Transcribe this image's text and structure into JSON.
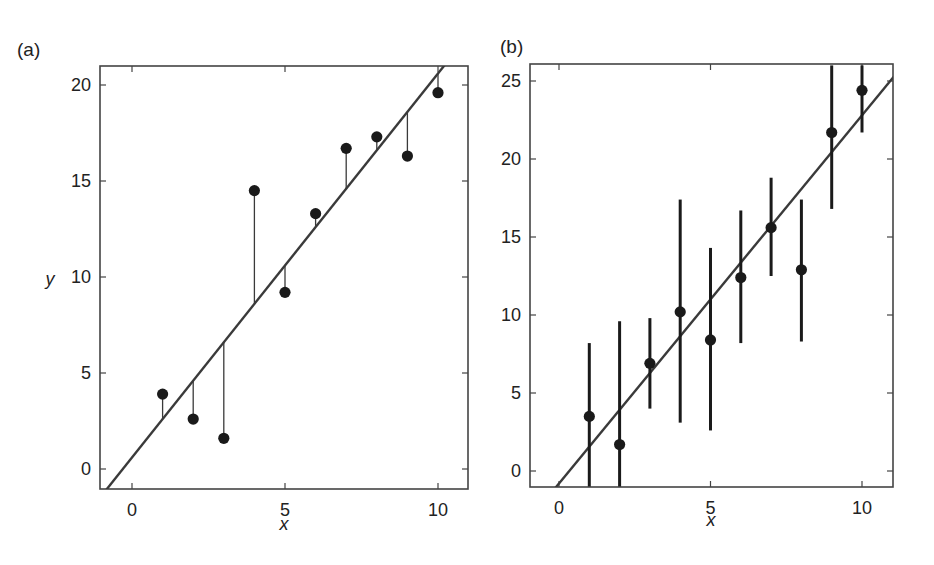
{
  "chart_data": [
    {
      "panel_label": "(a)",
      "type": "scatter",
      "subtype": "scatter with regression line and vertical residual lines",
      "xlabel": "x",
      "ylabel": "y",
      "xlim": [
        -1,
        11
      ],
      "ylim": [
        -1,
        21
      ],
      "xticks": [
        0,
        5,
        10
      ],
      "yticks": [
        0,
        5,
        10,
        15,
        20
      ],
      "grid": false,
      "legend": null,
      "x": [
        1,
        2,
        3,
        4,
        5,
        6,
        7,
        8,
        9,
        10
      ],
      "y": [
        3.9,
        2.6,
        1.6,
        14.5,
        9.2,
        13.3,
        16.7,
        17.3,
        16.3,
        19.6
      ],
      "fit_line": {
        "slope": 2.0,
        "intercept": 0.6
      },
      "residuals_shown": true
    },
    {
      "panel_label": "(b)",
      "type": "scatter",
      "subtype": "scatter with vertical error bars and regression line",
      "xlabel": "x",
      "ylabel": "",
      "xlim": [
        -1,
        11
      ],
      "ylim": [
        -1,
        26
      ],
      "xticks": [
        0,
        5,
        10
      ],
      "yticks": [
        0,
        5,
        10,
        15,
        20,
        25
      ],
      "grid": false,
      "legend": null,
      "x": [
        1,
        2,
        3,
        4,
        5,
        6,
        7,
        8,
        9,
        10
      ],
      "y": [
        3.5,
        1.7,
        6.9,
        10.2,
        8.4,
        12.4,
        15.6,
        12.9,
        21.7,
        24.4
      ],
      "error_low": [
        -1,
        -1,
        4.0,
        3.1,
        2.6,
        8.2,
        12.5,
        8.3,
        16.8,
        21.7
      ],
      "error_high": [
        8.2,
        9.6,
        9.8,
        17.4,
        14.3,
        16.7,
        18.8,
        17.4,
        26,
        26
      ],
      "fit_line": {
        "slope": 2.36,
        "intercept": -0.8
      }
    }
  ],
  "layout": {
    "panels": [
      {
        "frame": {
          "left": 100,
          "top": 66,
          "right": 468,
          "bottom": 489
        },
        "x0px": 132,
        "x10px": 438,
        "y0px": 469,
        "yTopVal": 20,
        "yTopPx": 85,
        "label_pos": [
          17,
          56
        ],
        "ylabel_pos": [
          50,
          285
        ],
        "xlabel_pos": [
          284,
          530
        ]
      },
      {
        "frame": {
          "left": 530,
          "top": 64,
          "right": 893,
          "bottom": 487
        },
        "x0px": 559,
        "x10px": 862,
        "y0px": 471,
        "yTopVal": 25,
        "yTopPx": 81,
        "label_pos": [
          500,
          53
        ],
        "ylabel_pos": null,
        "xlabel_pos": [
          711,
          526
        ]
      }
    ],
    "colors": {
      "ink": "#1a1a1a",
      "line": "#3a3a3a",
      "frame": "#444444",
      "background": "#ffffff"
    }
  }
}
